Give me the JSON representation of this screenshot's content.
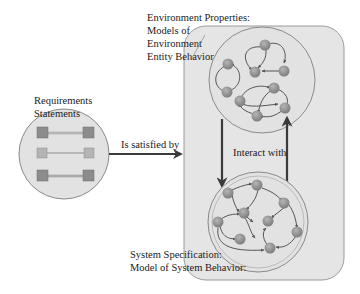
{
  "labels": {
    "requirements_line1": "Requirements",
    "requirements_line2": "Statements",
    "satisfied_by": "Is satisfied by",
    "env_line1": "Environment Properties:",
    "env_line2": "Models of",
    "env_line3": "Environment",
    "env_line4": "Entity Behavior",
    "interact_with": "Interact with",
    "sys_line1": "System Specification:",
    "sys_line2": "Model of System Behavior:"
  },
  "colors": {
    "container_fill": "#e5e5e5",
    "container_stroke": "#9a9a9a",
    "circle_fill": "#e2e2e2",
    "circle_stroke": "#8a8a8a",
    "node_fill": "#8f8f8f",
    "arrow": "#3a3a3a",
    "req_square_dark": "#8c8c8c",
    "req_square_light": "#b4b4b4"
  },
  "nodes": {
    "requirements": [
      "req-pair-1",
      "req-pair-2",
      "req-pair-3"
    ],
    "environment_count": 11,
    "system_count": 10
  }
}
